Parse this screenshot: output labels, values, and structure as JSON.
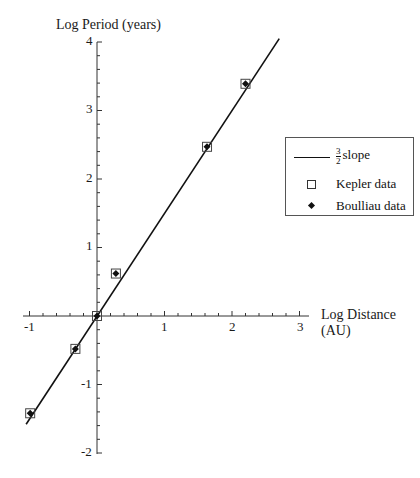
{
  "chart_data": {
    "type": "scatter",
    "title": "",
    "xlabel": "Log Distance (AU)",
    "ylabel": "Log Period (years)",
    "xlim": [
      -1,
      3
    ],
    "ylim": [
      -2,
      4
    ],
    "x_ticks": [
      "-1",
      "1",
      "2",
      "3"
    ],
    "y_ticks": [
      "4",
      "3",
      "2",
      "1",
      "-1",
      "-2"
    ],
    "grid": false,
    "legend_position": "right",
    "series": [
      {
        "name": "3/2 slope",
        "kind": "line",
        "slope": 1.5,
        "intercept": 0,
        "x": [
          -1.05,
          2.7
        ],
        "y": [
          -1.58,
          4.05
        ]
      },
      {
        "name": "Kepler data",
        "kind": "scatter",
        "marker": "open-square",
        "x": [
          -0.99,
          -0.32,
          0.0,
          0.28,
          1.63,
          2.2
        ],
        "y": [
          -1.42,
          -0.48,
          0.0,
          0.62,
          2.47,
          3.39
        ]
      },
      {
        "name": "Boulliau data",
        "kind": "scatter",
        "marker": "filled-diamond",
        "x": [
          -0.99,
          -0.32,
          0.0,
          0.28,
          1.63,
          2.2
        ],
        "y": [
          -1.42,
          -0.48,
          0.0,
          0.62,
          2.47,
          3.39
        ]
      }
    ]
  },
  "axes": {
    "y_title": "Log Period (years)",
    "x_title_line1": "Log Distance",
    "x_title_line2": "(AU)",
    "x_tick_labels": {
      "m1": "-1",
      "p1": "1",
      "p2": "2",
      "p3": "3"
    },
    "y_tick_labels": {
      "p4": "4",
      "p3": "3",
      "p2": "2",
      "p1": "1",
      "m1": "-1",
      "m2": "-2"
    }
  },
  "legend": {
    "slope_num": "3",
    "slope_den": "2",
    "slope_label": "slope",
    "kepler_label": "Kepler data",
    "boulliau_label": "Boulliau data"
  }
}
